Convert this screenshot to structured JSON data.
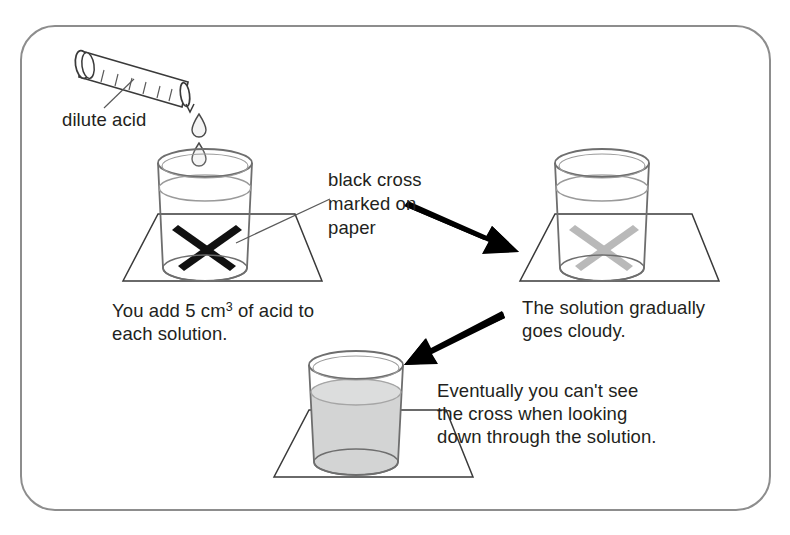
{
  "figure": {
    "frame": {
      "stroke": "#8d8d8d",
      "radius": 34
    }
  },
  "labels": {
    "dilute_acid": "dilute acid",
    "black_cross": "black cross\nmarked on\npaper",
    "add_acid_line1": "You add 5 cm",
    "add_acid_sup": "3",
    "add_acid_line2": " of acid to",
    "add_acid_line3": "each solution.",
    "cloudy": "The solution gradually\ngoes cloudy.",
    "final": "Eventually you can't see\nthe cross when looking\ndown through the solution."
  },
  "stages": [
    {
      "name": "stage-1-clear",
      "cross_visibility": "fully visible",
      "cross_color": "#1a1a1a",
      "liquid_color": "#f2f3f3",
      "liquid_opacity": 1
    },
    {
      "name": "stage-2-cloudy",
      "cross_visibility": "faded",
      "cross_color": "#b9b9b9",
      "liquid_color": "#f6f7f7",
      "liquid_opacity": 1
    },
    {
      "name": "stage-3-opaque",
      "cross_visibility": "hidden",
      "cross_color": "none",
      "liquid_color": "#d3d4d4",
      "liquid_opacity": 1
    }
  ],
  "colors": {
    "ink": "#231f20",
    "outline": "#3a3a3a",
    "glass": "#6e6e6e",
    "paper_line": "#3a3a3a",
    "arrow": "#000000",
    "droplet": "#f4f4f4"
  },
  "droplets": {
    "count": 2
  },
  "arrows": [
    {
      "name": "arrow-stage1-to-stage2",
      "direction": "down-right"
    },
    {
      "name": "arrow-stage2-to-stage3",
      "direction": "down-left"
    }
  ]
}
